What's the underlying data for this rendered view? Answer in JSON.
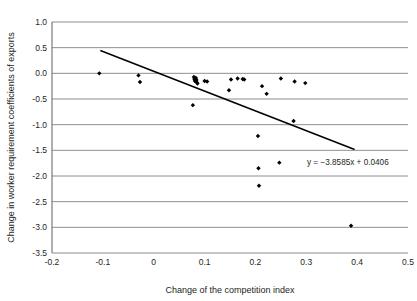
{
  "chart_data": {
    "type": "scatter",
    "title": "",
    "xlabel": "Change of the competition index",
    "ylabel": "Change in worker requirement coefficients of exports",
    "xlim": [
      -0.2,
      0.5
    ],
    "ylim": [
      -3.5,
      1.0
    ],
    "grid": true,
    "legend": "none",
    "xticks": [
      "-0.2",
      "-0.1",
      "0",
      "0.1",
      "0.2",
      "0.3",
      "0.4",
      "0.5"
    ],
    "xtick_values": [
      -0.2,
      -0.1,
      0,
      0.1,
      0.2,
      0.3,
      0.4,
      0.5
    ],
    "yticks": [
      "1.0",
      "0.5",
      "0.0",
      "-0.5",
      "-1.0",
      "-1.5",
      "-2.0",
      "-2.5",
      "-3.0",
      "-3.5"
    ],
    "ytick_values": [
      1.0,
      0.5,
      0.0,
      -0.5,
      -1.0,
      -1.5,
      -2.0,
      -2.5,
      -3.0,
      -3.5
    ],
    "annotation": "y = −3.8585x + 0.0406",
    "trendline": {
      "slope": -3.8585,
      "intercept": 0.0406,
      "x_start": -0.105,
      "x_end": 0.395
    },
    "points": [
      {
        "x": -0.107,
        "y": 0.0
      },
      {
        "x": -0.03,
        "y": -0.04
      },
      {
        "x": -0.027,
        "y": -0.17
      },
      {
        "x": 0.077,
        "y": -0.62
      },
      {
        "x": 0.079,
        "y": -0.07
      },
      {
        "x": 0.08,
        "y": -0.11
      },
      {
        "x": 0.081,
        "y": -0.15
      },
      {
        "x": 0.083,
        "y": -0.09
      },
      {
        "x": 0.084,
        "y": -0.13
      },
      {
        "x": 0.085,
        "y": -0.18
      },
      {
        "x": 0.086,
        "y": -0.2
      },
      {
        "x": 0.1,
        "y": -0.15
      },
      {
        "x": 0.105,
        "y": -0.16
      },
      {
        "x": 0.148,
        "y": -0.33
      },
      {
        "x": 0.152,
        "y": -0.12
      },
      {
        "x": 0.165,
        "y": -0.1
      },
      {
        "x": 0.175,
        "y": -0.11
      },
      {
        "x": 0.178,
        "y": -0.12
      },
      {
        "x": 0.205,
        "y": -1.22
      },
      {
        "x": 0.206,
        "y": -1.85
      },
      {
        "x": 0.207,
        "y": -2.19
      },
      {
        "x": 0.213,
        "y": -0.25
      },
      {
        "x": 0.222,
        "y": -0.4
      },
      {
        "x": 0.247,
        "y": -1.74
      },
      {
        "x": 0.25,
        "y": -0.1
      },
      {
        "x": 0.275,
        "y": -0.93
      },
      {
        "x": 0.277,
        "y": -0.16
      },
      {
        "x": 0.298,
        "y": -0.19
      },
      {
        "x": 0.388,
        "y": -2.97
      }
    ],
    "colors": {
      "point": "#000000",
      "trendline": "#000000",
      "gridline": "#808285",
      "axis": "#6d6e71",
      "text": "#231f20",
      "background": "#ffffff"
    }
  }
}
